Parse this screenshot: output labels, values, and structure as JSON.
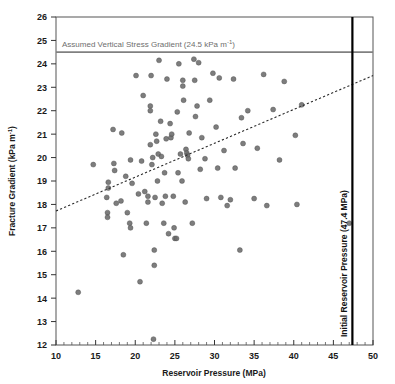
{
  "chart_data": {
    "type": "scatter",
    "title": "",
    "xlabel": "Reservoir Pressure (MPa)",
    "ylabel": "Fracture Gradient (kPa m⁻¹)",
    "xlim": [
      10,
      50
    ],
    "ylim": [
      12,
      26
    ],
    "xticks": [
      10,
      15,
      20,
      25,
      30,
      35,
      40,
      45,
      50
    ],
    "xtick_labels": [
      "10",
      "15",
      "20",
      "25",
      "30",
      "35",
      "40",
      "45",
      "50"
    ],
    "yticks": [
      12,
      13,
      14,
      15,
      16,
      17,
      18,
      19,
      20,
      21,
      22,
      23,
      24,
      25,
      26
    ],
    "ytick_labels": [
      "12",
      "13",
      "14",
      "15",
      "16",
      "17",
      "18",
      "19",
      "20",
      "21",
      "22",
      "23",
      "24",
      "25",
      "26"
    ],
    "grid": false,
    "legend": "none",
    "marker_color": "#6b6b6b",
    "marker_size": 4.6,
    "series": [
      {
        "name": "Fracture Gradient vs Reservoir Pressure",
        "points": [
          [
            12.8,
            14.25
          ],
          [
            14.7,
            19.7
          ],
          [
            16.4,
            18.3
          ],
          [
            16.5,
            17.65
          ],
          [
            16.5,
            17.45
          ],
          [
            16.6,
            18.95
          ],
          [
            16.6,
            18.7
          ],
          [
            17.2,
            21.2
          ],
          [
            17.3,
            19.75
          ],
          [
            17.4,
            19.45
          ],
          [
            17.6,
            18.05
          ],
          [
            18.2,
            18.15
          ],
          [
            18.3,
            21.05
          ],
          [
            18.5,
            15.85
          ],
          [
            18.8,
            19.2
          ],
          [
            19.0,
            17.65
          ],
          [
            19.3,
            17.2
          ],
          [
            19.4,
            19.9
          ],
          [
            19.4,
            17.0
          ],
          [
            19.6,
            18.9
          ],
          [
            20.1,
            23.5
          ],
          [
            20.4,
            18.45
          ],
          [
            20.6,
            14.7
          ],
          [
            20.8,
            19.85
          ],
          [
            21.0,
            22.65
          ],
          [
            21.2,
            18.55
          ],
          [
            21.4,
            17.2
          ],
          [
            21.6,
            18.1
          ],
          [
            21.6,
            18.35
          ],
          [
            21.9,
            22.2
          ],
          [
            21.9,
            22.0
          ],
          [
            21.9,
            20.55
          ],
          [
            22.0,
            23.5
          ],
          [
            22.1,
            19.7
          ],
          [
            22.2,
            20.0
          ],
          [
            22.3,
            12.25
          ],
          [
            22.4,
            16.05
          ],
          [
            22.4,
            15.4
          ],
          [
            22.5,
            18.3
          ],
          [
            22.6,
            21.0
          ],
          [
            22.7,
            20.7
          ],
          [
            22.8,
            19.0
          ],
          [
            22.9,
            20.15
          ],
          [
            23.0,
            24.15
          ],
          [
            23.2,
            21.55
          ],
          [
            23.3,
            20.05
          ],
          [
            23.4,
            18.05
          ],
          [
            23.6,
            17.2
          ],
          [
            23.7,
            19.35
          ],
          [
            23.8,
            18.35
          ],
          [
            23.9,
            20.8
          ],
          [
            24.0,
            23.35
          ],
          [
            24.2,
            16.75
          ],
          [
            24.4,
            21.45
          ],
          [
            24.5,
            20.85
          ],
          [
            24.6,
            21.0
          ],
          [
            24.8,
            18.35
          ],
          [
            24.9,
            17.0
          ],
          [
            25.0,
            16.55
          ],
          [
            25.2,
            16.55
          ],
          [
            25.3,
            21.95
          ],
          [
            25.4,
            19.35
          ],
          [
            25.5,
            24.0
          ],
          [
            25.7,
            20.15
          ],
          [
            25.9,
            19.0
          ],
          [
            26.0,
            23.3
          ],
          [
            26.0,
            23.05
          ],
          [
            26.1,
            22.45
          ],
          [
            26.3,
            18.1
          ],
          [
            26.4,
            20.35
          ],
          [
            26.5,
            20.2
          ],
          [
            26.6,
            20.1
          ],
          [
            26.7,
            19.95
          ],
          [
            26.8,
            21.05
          ],
          [
            27.2,
            17.2
          ],
          [
            27.4,
            24.2
          ],
          [
            27.5,
            23.3
          ],
          [
            27.6,
            21.75
          ],
          [
            27.8,
            22.2
          ],
          [
            28.0,
            24.05
          ],
          [
            28.2,
            19.5
          ],
          [
            28.4,
            20.85
          ],
          [
            28.8,
            19.95
          ],
          [
            29.0,
            18.25
          ],
          [
            29.4,
            22.45
          ],
          [
            29.8,
            23.6
          ],
          [
            30.2,
            21.3
          ],
          [
            30.4,
            19.55
          ],
          [
            30.6,
            23.4
          ],
          [
            30.8,
            18.3
          ],
          [
            31.2,
            20.3
          ],
          [
            31.6,
            17.95
          ],
          [
            32.0,
            18.2
          ],
          [
            32.4,
            23.35
          ],
          [
            32.6,
            19.55
          ],
          [
            33.2,
            16.05
          ],
          [
            33.4,
            21.7
          ],
          [
            33.6,
            20.6
          ],
          [
            34.2,
            22.0
          ],
          [
            35.0,
            18.25
          ],
          [
            35.4,
            20.4
          ],
          [
            36.2,
            23.55
          ],
          [
            36.6,
            17.95
          ],
          [
            37.4,
            22.05
          ],
          [
            38.2,
            19.9
          ],
          [
            38.8,
            23.25
          ],
          [
            40.2,
            20.95
          ],
          [
            40.4,
            18.0
          ],
          [
            41.0,
            22.25
          ],
          [
            47.0,
            17.2
          ]
        ]
      }
    ],
    "trendline": {
      "label": "linear trend",
      "style": "dotted",
      "color": "#2a2a2a",
      "x_start": 10,
      "y_start": 17.72,
      "x_end": 50,
      "y_end": 23.5
    },
    "reference_lines": [
      {
        "name": "assumed-vertical-stress-gradient",
        "orientation": "horizontal",
        "value": 24.5,
        "units": "kPa m⁻¹",
        "label": "Assumed Vertical Stress Gradient (24.5 kPa m⁻¹)",
        "label_main": "Assumed Vertical Stress Gradient (24.5 kPa m",
        "label_sup": "-1",
        "label_tail": ")",
        "color": "#808080"
      },
      {
        "name": "initial-reservoir-pressure",
        "orientation": "vertical",
        "value": 47.4,
        "units": "MPa",
        "label": "Initial Reservoir Pressure (47.4 MPa)",
        "color": "#000000"
      }
    ],
    "ylabel_main": "Fracture Gradient (kPa m",
    "ylabel_sup": "-1",
    "ylabel_tail": ")"
  },
  "axes": {
    "frame_color": "#4d4d4d"
  }
}
